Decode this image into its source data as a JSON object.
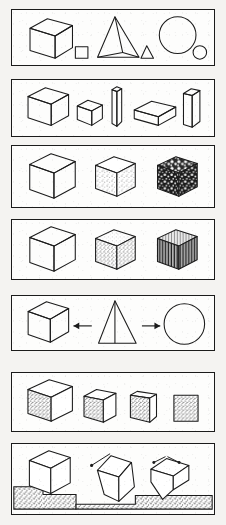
{
  "figure": {
    "page_background": "#f4f3f1",
    "ink_color": "#1b1b1b",
    "panel_fill": "#fdfdfc",
    "panel_count": 7
  },
  "panels": [
    {
      "id": "panel-1",
      "name": "solids-with-plane-counterparts",
      "caption": "Cube with square, pyramid with triangle, sphere with circle",
      "objects": [
        {
          "name": "large-cube",
          "kind": "cube",
          "shading": "outline"
        },
        {
          "name": "small-square",
          "kind": "square",
          "shading": "outline"
        },
        {
          "name": "pyramid",
          "kind": "pyramid",
          "shading": "outline"
        },
        {
          "name": "small-triangle",
          "kind": "triangle",
          "shading": "outline"
        },
        {
          "name": "large-circle",
          "kind": "circle",
          "shading": "outline"
        },
        {
          "name": "small-circle",
          "kind": "circle",
          "shading": "outline"
        }
      ]
    },
    {
      "id": "panel-2",
      "name": "rectangular-solids-varying-proportion",
      "caption": "Cube, small cube, thin column, flat slab, upright plate",
      "objects": [
        {
          "name": "large-cube",
          "kind": "cube",
          "shading": "outline"
        },
        {
          "name": "small-cube",
          "kind": "cube",
          "shading": "outline"
        },
        {
          "name": "thin-column",
          "kind": "column",
          "shading": "outline"
        },
        {
          "name": "flat-slab",
          "kind": "slab",
          "shading": "outline"
        },
        {
          "name": "upright-plate",
          "kind": "plate",
          "shading": "outline"
        }
      ]
    },
    {
      "id": "panel-3",
      "name": "cubes-increasing-surface-texture",
      "caption": "Plain cube, lightly speckled cube, heavily mottled cube",
      "objects": [
        {
          "name": "plain-cube",
          "kind": "cube",
          "shading": "outline"
        },
        {
          "name": "speckled-cube",
          "kind": "cube",
          "shading": "stipple-light"
        },
        {
          "name": "mottled-cube",
          "kind": "cube",
          "shading": "mottle-heavy"
        }
      ]
    },
    {
      "id": "panel-4",
      "name": "cubes-material-variation",
      "caption": "Plain cube, grainy cube, vertically striated cube",
      "objects": [
        {
          "name": "plain-cube",
          "kind": "cube",
          "shading": "outline"
        },
        {
          "name": "grainy-cube",
          "kind": "cube",
          "shading": "stipple-medium"
        },
        {
          "name": "striated-cube",
          "kind": "cube",
          "shading": "stripes-vertical"
        }
      ]
    },
    {
      "id": "panel-5",
      "name": "pyramid-derivations",
      "caption": "Pyramid at centre with arrows to cube and circle",
      "objects": [
        {
          "name": "cube",
          "kind": "cube",
          "shading": "outline"
        },
        {
          "name": "left-arrow",
          "kind": "arrow",
          "direction": "left"
        },
        {
          "name": "pyramid",
          "kind": "pyramid",
          "shading": "outline"
        },
        {
          "name": "right-arrow",
          "kind": "arrow",
          "direction": "right"
        },
        {
          "name": "circle",
          "kind": "circle",
          "shading": "outline"
        }
      ]
    },
    {
      "id": "panel-6",
      "name": "cube-rotation-to-flat-square",
      "caption": "Four speckled cubes rotating toward a flat square face",
      "objects": [
        {
          "name": "cube-step-1",
          "kind": "cube",
          "shading": "stipple-face"
        },
        {
          "name": "cube-step-2",
          "kind": "cube",
          "shading": "stipple-face"
        },
        {
          "name": "cube-step-3",
          "kind": "cube",
          "shading": "stipple-face"
        },
        {
          "name": "cube-step-4",
          "kind": "square",
          "shading": "stipple-face"
        }
      ]
    },
    {
      "id": "panel-7",
      "name": "cube-tipping-on-ground",
      "caption": "Cube resting in ground, then tilted on a corner with motion arrows",
      "objects": [
        {
          "name": "resting-cube",
          "kind": "cube",
          "shading": "outline"
        },
        {
          "name": "ground-left",
          "kind": "ground",
          "shading": "stipple-ground"
        },
        {
          "name": "tilted-cube",
          "kind": "cube",
          "shading": "outline"
        },
        {
          "name": "motion-arrow-1",
          "kind": "arrow",
          "direction": "upper-left"
        },
        {
          "name": "balanced-cube",
          "kind": "cube",
          "shading": "outline"
        },
        {
          "name": "motion-arrow-2",
          "kind": "arrow",
          "direction": "upper-left"
        },
        {
          "name": "motion-arrow-3",
          "kind": "arrow",
          "direction": "upper-right"
        },
        {
          "name": "ground-right",
          "kind": "ground",
          "shading": "stipple-ground"
        }
      ]
    }
  ]
}
